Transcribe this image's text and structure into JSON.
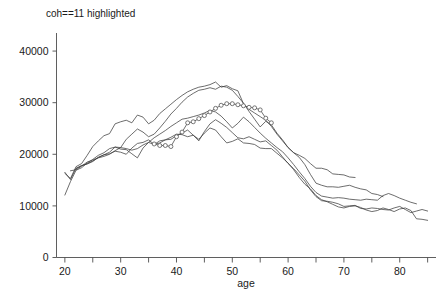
{
  "chart_data": {
    "type": "line",
    "title": "coh==11 highlighted",
    "xlabel": "age",
    "ylabel": "",
    "xlim": [
      18.5,
      86.5
    ],
    "ylim": [
      0,
      43500
    ],
    "grid": false,
    "legend": "none",
    "x_ticks": [
      20,
      25,
      30,
      35,
      40,
      45,
      50,
      55,
      60,
      65,
      70,
      75,
      80,
      85
    ],
    "x_tick_labels": [
      "20",
      "",
      "30",
      "",
      "40",
      "",
      "50",
      "",
      "60",
      "",
      "70",
      "",
      "80",
      ""
    ],
    "y_ticks": [
      0,
      10000,
      20000,
      30000,
      40000
    ],
    "y_tick_labels": [
      "0",
      "10000",
      "20000",
      "30000",
      "40000"
    ],
    "highlighted_series": "coh==11",
    "marker_shape": "open-circle",
    "series": [
      {
        "name": "cohort-1",
        "highlighted": false,
        "x": [
          20,
          21,
          22,
          23,
          24,
          25,
          26,
          27,
          28,
          29,
          30,
          31,
          32,
          33,
          34,
          35,
          36,
          37,
          38,
          39,
          40,
          41,
          42,
          43,
          44,
          45,
          46,
          47,
          48,
          49,
          50,
          51,
          52,
          53,
          54,
          55,
          56,
          57,
          58,
          59,
          60,
          61,
          62,
          63,
          64,
          65,
          66,
          67,
          68,
          69,
          70,
          71,
          72
        ],
        "values": [
          16300,
          15300,
          17600,
          18200,
          19800,
          21500,
          22600,
          23600,
          24000,
          25900,
          26300,
          26600,
          26100,
          27600,
          27200,
          25900,
          26600,
          27900,
          28800,
          29700,
          30600,
          31400,
          32100,
          32600,
          33000,
          33200,
          33500,
          34000,
          33000,
          33300,
          32700,
          32300,
          29800,
          28700,
          28000,
          27300,
          26600,
          25400,
          23900,
          22600,
          21300,
          20300,
          19800,
          19200,
          18200,
          17300,
          17300,
          17000,
          16200,
          16100,
          16000,
          15600,
          15500
        ]
      },
      {
        "name": "cohort-2",
        "highlighted": false,
        "x": [
          20,
          21,
          22,
          23,
          24,
          25,
          26,
          27,
          28,
          29,
          30,
          31,
          32,
          33,
          34,
          35,
          36,
          37,
          38,
          39,
          40,
          41,
          42,
          43,
          44,
          45,
          46,
          47,
          48,
          49,
          50,
          51,
          52,
          53,
          54,
          55,
          56,
          57,
          58,
          59,
          60,
          61,
          62,
          63,
          64,
          65,
          66,
          67,
          68,
          69,
          70,
          71,
          72,
          73,
          74,
          75,
          76,
          77
        ],
        "values": [
          12100,
          14700,
          16900,
          17400,
          18300,
          19000,
          19800,
          20300,
          21100,
          21400,
          21300,
          22900,
          23900,
          24900,
          24300,
          23400,
          23900,
          25100,
          26400,
          27800,
          28900,
          30100,
          31100,
          31800,
          32400,
          32600,
          32900,
          32600,
          33200,
          33000,
          32400,
          31200,
          29900,
          28300,
          26800,
          25300,
          26400,
          25700,
          24100,
          22800,
          21300,
          20300,
          19400,
          18000,
          16100,
          14400,
          14000,
          13700,
          13700,
          13600,
          13800,
          14000,
          13600,
          13300,
          13100,
          12400,
          12200,
          11800
        ]
      },
      {
        "name": "cohort-3",
        "highlighted": false,
        "x": [
          20,
          21,
          22,
          23,
          24,
          25,
          26,
          27,
          28,
          29,
          30,
          31,
          32,
          33,
          34,
          35,
          36,
          37,
          38,
          39,
          40,
          41,
          42,
          43,
          44,
          45,
          46,
          47,
          48,
          49,
          50,
          51,
          52,
          53,
          54,
          55,
          56,
          57,
          58,
          59,
          60,
          61,
          62,
          63,
          64,
          65,
          66,
          67,
          68,
          69,
          70,
          71,
          72,
          73,
          74,
          75,
          76,
          77,
          78,
          79,
          80,
          81,
          82,
          83
        ],
        "values": [
          16500,
          15100,
          17300,
          17800,
          18200,
          18700,
          19400,
          19900,
          20400,
          21400,
          21000,
          20900,
          20100,
          19300,
          21200,
          22300,
          23200,
          23900,
          24600,
          25400,
          26100,
          26800,
          27000,
          27300,
          27600,
          28000,
          28500,
          28200,
          27400,
          26300,
          25100,
          26000,
          27200,
          26300,
          25200,
          24100,
          23100,
          22200,
          21300,
          20500,
          19300,
          18000,
          16600,
          15300,
          13800,
          12600,
          11900,
          11700,
          11500,
          11600,
          11500,
          11300,
          11200,
          11100,
          11300,
          11200,
          11100,
          12000,
          12400,
          12000,
          11500,
          11100,
          10700,
          10400
        ]
      },
      {
        "name": "cohort-4",
        "highlighted": false,
        "x": [
          21,
          22,
          23,
          24,
          25,
          26,
          27,
          28,
          29,
          30,
          31,
          32,
          33,
          34,
          35,
          36,
          37,
          38,
          39,
          40,
          41,
          42,
          43,
          44,
          45,
          46,
          47,
          48,
          49,
          50,
          51,
          52,
          53,
          54,
          55,
          56,
          57,
          58,
          59,
          60,
          61,
          62,
          63,
          64,
          65,
          66,
          67,
          68,
          69,
          70,
          71,
          72,
          73,
          74,
          75,
          76,
          77,
          78,
          79,
          80,
          81,
          82,
          83,
          84,
          85
        ],
        "values": [
          16800,
          17000,
          17700,
          18500,
          18900,
          19300,
          19600,
          20000,
          20700,
          21300,
          21100,
          20800,
          21100,
          21800,
          22300,
          21900,
          22600,
          22800,
          22900,
          23600,
          24100,
          24700,
          23700,
          22600,
          24400,
          25900,
          26700,
          26000,
          25200,
          24200,
          23200,
          23000,
          23400,
          22900,
          22400,
          22600,
          21700,
          20800,
          19500,
          18200,
          17200,
          16000,
          14800,
          13100,
          11800,
          11000,
          10900,
          10700,
          10400,
          9900,
          10000,
          10100,
          9500,
          9400,
          9600,
          9500,
          9300,
          9200,
          9600,
          9900,
          9300,
          8700,
          9000,
          9300,
          9000
        ]
      },
      {
        "name": "cohort-5",
        "highlighted": false,
        "x": [
          22,
          23,
          24,
          25,
          26,
          27,
          28,
          29,
          30,
          31,
          32,
          33,
          34,
          35,
          36,
          37,
          38,
          39,
          40,
          41,
          42,
          43,
          44,
          45,
          46,
          47,
          48,
          49,
          50,
          51,
          52,
          53,
          54,
          55,
          56,
          57,
          58,
          59,
          60,
          61,
          62,
          63,
          64,
          65,
          66,
          67,
          68,
          69,
          70,
          71,
          72,
          73,
          74,
          75,
          76,
          77,
          78,
          79,
          80,
          81,
          82,
          83,
          84,
          85
        ],
        "values": [
          17200,
          17800,
          18100,
          18600,
          19400,
          19900,
          20100,
          20600,
          20400,
          20000,
          21200,
          22100,
          22300,
          22800,
          21900,
          22200,
          22800,
          23300,
          23900,
          23800,
          23400,
          23700,
          22900,
          24100,
          25100,
          24700,
          23400,
          22200,
          22500,
          23000,
          22200,
          22100,
          21900,
          21200,
          21100,
          21100,
          20200,
          19300,
          18300,
          17000,
          15500,
          14200,
          13300,
          12000,
          11200,
          10800,
          10300,
          9800,
          9600,
          9900,
          10000,
          9700,
          9200,
          8900,
          9100,
          9600,
          9300,
          8900,
          9400,
          9600,
          9100,
          7500,
          7400,
          7200
        ]
      },
      {
        "name": "coh==11",
        "highlighted": true,
        "x": [
          36,
          37,
          38,
          39,
          40,
          41,
          42,
          43,
          44,
          45,
          46,
          47,
          48,
          49,
          50,
          51,
          52,
          53,
          54,
          55,
          56,
          57
        ],
        "values": [
          22000,
          21700,
          21700,
          21500,
          23400,
          24300,
          26100,
          26300,
          26900,
          27500,
          28200,
          28900,
          29500,
          29800,
          29800,
          29600,
          29400,
          29100,
          29000,
          28600,
          27000,
          26100
        ]
      }
    ]
  }
}
